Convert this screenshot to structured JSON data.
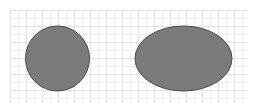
{
  "canvas": {
    "width": 261,
    "height": 111,
    "background": "#ffffff"
  },
  "grid": {
    "x0": 10,
    "y0": 10,
    "x1": 248,
    "y1": 103,
    "major_step": 16,
    "minor_step": 8,
    "major_color": "#e2e2e2",
    "minor_color": "#f1f1f1"
  },
  "shapes": [
    {
      "name": "circle",
      "type": "ellipse",
      "cx": 57.5,
      "cy": 58.5,
      "rx": 32,
      "ry": 32.5,
      "fill": "#7b7b7b",
      "stroke": "#4a4a4a",
      "stroke_width": 1
    },
    {
      "name": "ellipse",
      "type": "ellipse",
      "cx": 183.5,
      "cy": 58.5,
      "rx": 48.5,
      "ry": 32.5,
      "fill": "#7b7b7b",
      "stroke": "#4a4a4a",
      "stroke_width": 1
    }
  ]
}
